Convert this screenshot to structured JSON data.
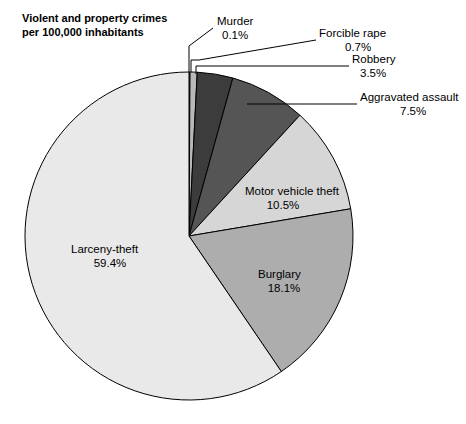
{
  "title": {
    "line1": "Violent and property crimes",
    "line2": "per 100,000 inhabitants"
  },
  "chart_data": {
    "type": "pie",
    "title": "Violent and property crimes per 100,000 inhabitants",
    "units": "percent",
    "start_angle_deg": 0,
    "direction": "clockwise",
    "legend": "none",
    "labels_inside": [
      "Motor vehicle theft",
      "Burglary",
      "Larceny-theft"
    ],
    "labels_callout": [
      "Murder",
      "Forcible rape",
      "Robbery",
      "Aggravated assault"
    ],
    "categories": [
      "Murder",
      "Forcible rape",
      "Robbery",
      "Aggravated assault",
      "Motor vehicle theft",
      "Burglary",
      "Larceny-theft"
    ],
    "values": [
      0.1,
      0.7,
      3.5,
      7.5,
      10.5,
      18.1,
      59.4
    ],
    "slices": [
      {
        "name": "Murder",
        "value": 0.1,
        "value_text": "0.1%",
        "color": "#f0f0f0",
        "label_mode": "callout"
      },
      {
        "name": "Forcible rape",
        "value": 0.7,
        "value_text": "0.7%",
        "color": "#b8b8b8",
        "label_mode": "callout"
      },
      {
        "name": "Robbery",
        "value": 3.5,
        "value_text": "3.5%",
        "color": "#3c3c3c",
        "label_mode": "callout"
      },
      {
        "name": "Aggravated assault",
        "value": 7.5,
        "value_text": "7.5%",
        "color": "#555555",
        "label_mode": "callout"
      },
      {
        "name": "Motor vehicle theft",
        "value": 10.5,
        "value_text": "10.5%",
        "color": "#d6d6d6",
        "label_mode": "inside"
      },
      {
        "name": "Burglary",
        "value": 18.1,
        "value_text": "18.1%",
        "color": "#adadad",
        "label_mode": "inside"
      },
      {
        "name": "Larceny-theft",
        "value": 59.4,
        "value_text": "59.4%",
        "color": "#e9e9e9",
        "label_mode": "inside"
      }
    ]
  },
  "callouts": {
    "murder": {
      "name": "Murder",
      "value_text": "0.1%"
    },
    "forcible_rape": {
      "name": "Forcible rape",
      "value_text": "0.7%"
    },
    "robbery": {
      "name": "Robbery",
      "value_text": "3.5%"
    },
    "aggravated_assault": {
      "name": "Aggravated assault",
      "value_text": "7.5%"
    }
  },
  "inside_labels": {
    "motor_vehicle_theft": {
      "name": "Motor vehicle theft",
      "value_text": "10.5%"
    },
    "burglary": {
      "name": "Burglary",
      "value_text": "18.1%"
    },
    "larceny_theft": {
      "name": "Larceny-theft",
      "value_text": "59.4%"
    }
  },
  "colors": {
    "background": "#ffffff",
    "outline": "#000000",
    "murder": "#f0f0f0",
    "forcible_rape": "#b8b8b8",
    "robbery": "#3c3c3c",
    "aggravated_assault": "#555555",
    "motor_vehicle_theft": "#d6d6d6",
    "burglary": "#adadad",
    "larceny_theft": "#e9e9e9"
  }
}
